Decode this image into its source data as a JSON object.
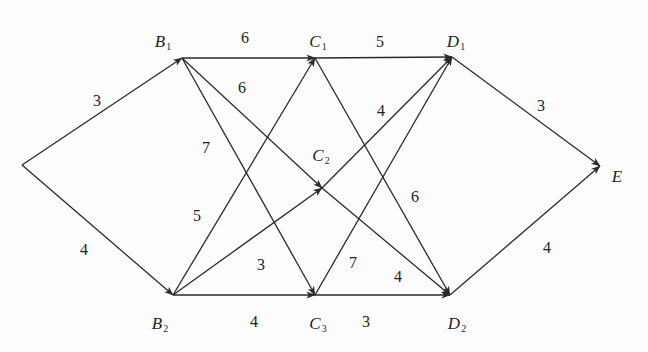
{
  "diagram": {
    "type": "directed-weighted-graph",
    "nodes": [
      {
        "id": "A",
        "name": "",
        "sub": "",
        "x": 22,
        "y": 165,
        "lx": 0,
        "ly": 0
      },
      {
        "id": "B1",
        "name": "B",
        "sub": "1",
        "x": 182,
        "y": 58,
        "lx": 163,
        "ly": 42
      },
      {
        "id": "B2",
        "name": "B",
        "sub": "2",
        "x": 173,
        "y": 295,
        "lx": 160,
        "ly": 324
      },
      {
        "id": "C1",
        "name": "C",
        "sub": "1",
        "x": 315,
        "y": 58,
        "lx": 318,
        "ly": 42
      },
      {
        "id": "C2",
        "name": "C",
        "sub": "2",
        "x": 322,
        "y": 188,
        "lx": 321,
        "ly": 156
      },
      {
        "id": "C3",
        "name": "C",
        "sub": "3",
        "x": 315,
        "y": 295,
        "lx": 318,
        "ly": 324
      },
      {
        "id": "D1",
        "name": "D",
        "sub": "1",
        "x": 452,
        "y": 57,
        "lx": 456,
        "ly": 42
      },
      {
        "id": "D2",
        "name": "D",
        "sub": "2",
        "x": 450,
        "y": 295,
        "lx": 457,
        "ly": 324
      },
      {
        "id": "E",
        "name": "E",
        "sub": "",
        "x": 600,
        "y": 166,
        "lx": 617,
        "ly": 176
      }
    ],
    "edges": [
      {
        "from": "A",
        "to": "B1",
        "weight": "3",
        "lx": 97,
        "ly": 101
      },
      {
        "from": "A",
        "to": "B2",
        "weight": "4",
        "lx": 84,
        "ly": 250
      },
      {
        "from": "B1",
        "to": "C1",
        "weight": "6",
        "lx": 245,
        "ly": 38
      },
      {
        "from": "B1",
        "to": "C2",
        "weight": "6",
        "lx": 242,
        "ly": 88
      },
      {
        "from": "B1",
        "to": "C3",
        "weight": "7",
        "lx": 206,
        "ly": 148
      },
      {
        "from": "B2",
        "to": "C1",
        "weight": "5",
        "lx": 197,
        "ly": 216
      },
      {
        "from": "B2",
        "to": "C2",
        "weight": "3",
        "lx": 261,
        "ly": 265
      },
      {
        "from": "B2",
        "to": "C3",
        "weight": "4",
        "lx": 254,
        "ly": 322
      },
      {
        "from": "C1",
        "to": "D1",
        "weight": "5",
        "lx": 380,
        "ly": 42
      },
      {
        "from": "C1",
        "to": "D2",
        "weight": "6",
        "lx": 415,
        "ly": 197
      },
      {
        "from": "C2",
        "to": "D1",
        "weight": "4",
        "lx": 381,
        "ly": 111
      },
      {
        "from": "C2",
        "to": "D2",
        "weight": "4",
        "lx": 398,
        "ly": 277
      },
      {
        "from": "C3",
        "to": "D1",
        "weight": "7",
        "lx": 353,
        "ly": 263
      },
      {
        "from": "C3",
        "to": "D2",
        "weight": "3",
        "lx": 366,
        "ly": 322
      },
      {
        "from": "D1",
        "to": "E",
        "weight": "3",
        "lx": 541,
        "ly": 106
      },
      {
        "from": "D2",
        "to": "E",
        "weight": "4",
        "lx": 547,
        "ly": 248
      }
    ]
  }
}
